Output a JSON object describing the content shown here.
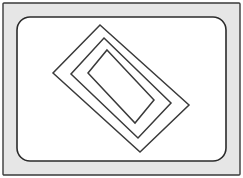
{
  "canvas": {
    "width": 243,
    "height": 178,
    "background": "#ffffff",
    "title": "Nested rotated rectangles inside a framed panel"
  },
  "colors": {
    "background": "#ffffff",
    "frame_fill": "#e6e6e6",
    "frame_stroke": "#3a3a3a",
    "panel_fill": "#ffffff",
    "panel_stroke": "#2b2b2b",
    "shape_stroke": "#3a3a3a",
    "shape_fill": "none"
  },
  "frame": {
    "label": "outer-frame",
    "x": 3,
    "y": 3,
    "width": 237,
    "height": 172,
    "stroke_width": 1.4,
    "corner_radius": 1
  },
  "panel": {
    "label": "inner-panel",
    "x": 17,
    "y": 17,
    "width": 209,
    "height": 144,
    "corner_radius": 13,
    "stroke_width": 1.6
  },
  "shapes": {
    "rotation_degrees": 37,
    "center_x": 121,
    "center_y": 89,
    "count": 3,
    "rectangles": [
      {
        "name": "outer-rotated-rectangle",
        "index": 1,
        "half_width": 84,
        "half_height": 46,
        "stroke_width": 1.5,
        "vertices": "100,25 189,105 140,152 53,73"
      },
      {
        "name": "middle-rotated-rectangle",
        "index": 2,
        "half_width": 68,
        "half_height": 33,
        "stroke_width": 1.5,
        "vertices": "104,38 171,103 138,138 71,74"
      },
      {
        "name": "inner-rotated-rectangle",
        "index": 3,
        "half_width": 52,
        "half_height": 21,
        "stroke_width": 1.5,
        "vertices": "107,50 154,100 135,123 88,73"
      }
    ]
  }
}
